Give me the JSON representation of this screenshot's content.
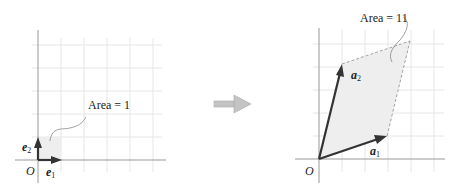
{
  "left_panel": {
    "origin_label": "O",
    "vector_1": {
      "name": "e",
      "sub": "1"
    },
    "vector_2": {
      "name": "e",
      "sub": "2"
    },
    "area_label": "Area = 1"
  },
  "arrow": {
    "icon": "right-arrow-icon",
    "color": "#b3b3b3"
  },
  "right_panel": {
    "origin_label": "O",
    "vector_1": {
      "name": "a",
      "sub": "1"
    },
    "vector_2": {
      "name": "a",
      "sub": "2"
    },
    "area_label": "Area = 11"
  },
  "colors": {
    "grid": "#e6e6e6",
    "axis": "#999999",
    "vector": "#333333",
    "fill": "#eeeeee"
  }
}
